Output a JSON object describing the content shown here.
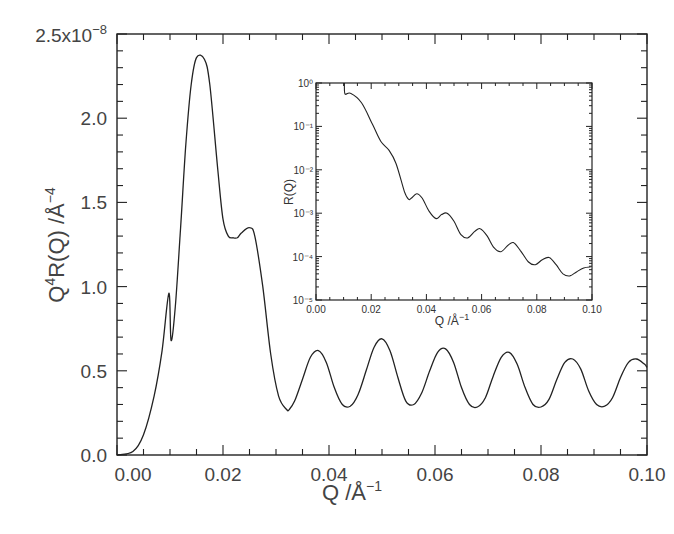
{
  "chart_data": [
    {
      "id": "main",
      "type": "line",
      "title": "",
      "xlabel": "Q /Å⁻¹",
      "ylabel": "Q⁴R(Q) /Å⁻⁴",
      "y_multiplier": "x10^-8",
      "xlim": [
        0.0,
        0.1
      ],
      "ylim": [
        0.0,
        2.5
      ],
      "x_ticks": [
        "0.00",
        "0.02",
        "0.04",
        "0.06",
        "0.08",
        "0.10"
      ],
      "y_ticks": [
        "0.0",
        "0.5",
        "1.0",
        "1.5",
        "2.0",
        "2.5x10⁻⁸"
      ],
      "grid": false,
      "series": [
        {
          "name": "Q^4 R(Q)",
          "x": [
            0.0,
            0.003,
            0.005,
            0.007,
            0.0085,
            0.0098,
            0.0102,
            0.011,
            0.012,
            0.013,
            0.014,
            0.015,
            0.0165,
            0.0175,
            0.019,
            0.02,
            0.021,
            0.022,
            0.0227,
            0.0235,
            0.025,
            0.026,
            0.0275,
            0.029,
            0.0305,
            0.032,
            0.0325,
            0.0335,
            0.035,
            0.0365,
            0.038,
            0.0395,
            0.041,
            0.0425,
            0.044,
            0.0455,
            0.047,
            0.0485,
            0.05,
            0.0515,
            0.053,
            0.0545,
            0.056,
            0.0575,
            0.059,
            0.0605,
            0.062,
            0.0635,
            0.065,
            0.0665,
            0.068,
            0.0695,
            0.071,
            0.0725,
            0.074,
            0.0755,
            0.077,
            0.0785,
            0.08,
            0.0815,
            0.083,
            0.0845,
            0.086,
            0.0875,
            0.089,
            0.0905,
            0.092,
            0.0935,
            0.095,
            0.0965,
            0.098,
            0.0995,
            0.1
          ],
          "y": [
            0.0,
            0.02,
            0.12,
            0.35,
            0.62,
            0.96,
            0.68,
            0.88,
            1.35,
            1.85,
            2.2,
            2.36,
            2.35,
            2.2,
            1.7,
            1.4,
            1.3,
            1.29,
            1.29,
            1.32,
            1.35,
            1.3,
            1.0,
            0.6,
            0.35,
            0.27,
            0.27,
            0.32,
            0.45,
            0.58,
            0.62,
            0.55,
            0.4,
            0.3,
            0.29,
            0.36,
            0.5,
            0.64,
            0.69,
            0.62,
            0.46,
            0.32,
            0.3,
            0.37,
            0.5,
            0.61,
            0.63,
            0.55,
            0.4,
            0.3,
            0.285,
            0.34,
            0.47,
            0.58,
            0.61,
            0.54,
            0.4,
            0.3,
            0.285,
            0.33,
            0.45,
            0.55,
            0.57,
            0.51,
            0.38,
            0.3,
            0.29,
            0.34,
            0.46,
            0.55,
            0.57,
            0.54,
            0.52
          ]
        }
      ]
    },
    {
      "id": "inset",
      "type": "line",
      "title": "",
      "xlabel": "Q /Å⁻¹",
      "ylabel": "R(Q)",
      "yscale": "log",
      "xlim": [
        0.0,
        0.1
      ],
      "ylim": [
        1e-05,
        1.0
      ],
      "x_ticks": [
        "0.00",
        "0.02",
        "0.04",
        "0.06",
        "0.08",
        "0.10"
      ],
      "y_ticks": [
        "10⁻⁵",
        "10⁻⁴",
        "10⁻³",
        "10⁻²",
        "10⁻¹",
        "10⁰"
      ],
      "grid": false,
      "series": [
        {
          "name": "R(Q)",
          "x": [
            0.0103,
            0.0105,
            0.0125,
            0.0165,
            0.0205,
            0.0235,
            0.0265,
            0.029,
            0.032,
            0.0335,
            0.0345,
            0.0365,
            0.0385,
            0.041,
            0.0435,
            0.0455,
            0.0475,
            0.05,
            0.0525,
            0.055,
            0.0575,
            0.0595,
            0.062,
            0.0645,
            0.067,
            0.0695,
            0.0715,
            0.074,
            0.077,
            0.0795,
            0.082,
            0.0845,
            0.087,
            0.0895,
            0.092,
            0.0945,
            0.097,
            0.0995
          ],
          "y": [
            1.0,
            0.56,
            0.58,
            0.35,
            0.11,
            0.045,
            0.028,
            0.014,
            0.0032,
            0.0021,
            0.0022,
            0.0028,
            0.0022,
            0.0011,
            0.00075,
            0.00093,
            0.001,
            0.00065,
            0.00032,
            0.00027,
            0.00038,
            0.00044,
            0.0003,
            0.00016,
            0.00013,
            0.00018,
            0.00021,
            0.00014,
            7.5e-05,
            6.5e-05,
            8.5e-05,
            9.5e-05,
            6.5e-05,
            4e-05,
            3.6e-05,
            4.5e-05,
            5.5e-05,
            5.8e-05
          ]
        }
      ]
    }
  ],
  "labels": {
    "main_y_top": "2.5x10",
    "main_y_top_exp": "−8",
    "main_y_label": "Q",
    "main_y_label_sup": "4",
    "main_y_label_rest": "R(Q)  /Å",
    "main_y_label_exp": "−4",
    "main_x_label": "Q  /Å",
    "main_x_label_exp": "−1",
    "inset_y_label": "R(Q)",
    "inset_x_label": "Q  /Å",
    "inset_x_label_exp": "−1"
  }
}
